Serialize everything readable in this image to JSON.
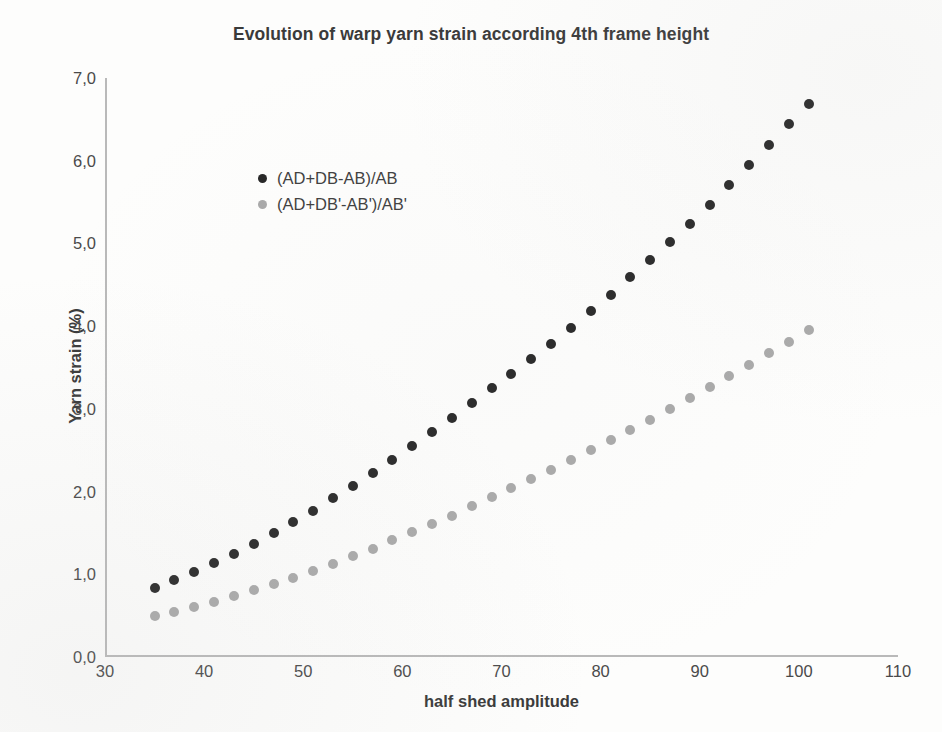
{
  "chart_data": {
    "type": "scatter",
    "title": "Evolution of warp yarn strain according 4th frame height",
    "xlabel": "half shed amplitude",
    "ylabel": "Yarn strain (%)",
    "xlim": [
      30,
      110
    ],
    "ylim": [
      0.0,
      7.0
    ],
    "xticks": [
      30,
      40,
      50,
      60,
      70,
      80,
      90,
      100,
      110
    ],
    "xtick_labels": [
      "30",
      "40",
      "50",
      "60",
      "70",
      "80",
      "90",
      "100",
      "110"
    ],
    "yticks": [
      0.0,
      1.0,
      2.0,
      3.0,
      4.0,
      5.0,
      6.0,
      7.0
    ],
    "ytick_labels": [
      "0,0",
      "1,0",
      "2,0",
      "3,0",
      "4,0",
      "5,0",
      "6,0",
      "7,0"
    ],
    "decimal_separator": ",",
    "grid": false,
    "legend_position": "upper-left-inside",
    "x": [
      35,
      37,
      39,
      41,
      43,
      45,
      47,
      49,
      51,
      53,
      55,
      57,
      59,
      61,
      63,
      65,
      67,
      69,
      71,
      73,
      75,
      77,
      79,
      81,
      83,
      85,
      87,
      89,
      91,
      93,
      95,
      97,
      99,
      101
    ],
    "series": [
      {
        "name": "(AD+DB-AB)/AB",
        "color": "#262626",
        "marker": "circle",
        "values": [
          0.84,
          0.93,
          1.03,
          1.14,
          1.25,
          1.37,
          1.5,
          1.63,
          1.77,
          1.92,
          2.07,
          2.22,
          2.38,
          2.55,
          2.72,
          2.89,
          3.07,
          3.25,
          3.42,
          3.6,
          3.79,
          3.98,
          4.18,
          4.38,
          4.59,
          4.8,
          5.02,
          5.24,
          5.47,
          5.71,
          5.95,
          6.19,
          6.44,
          6.69
        ]
      },
      {
        "name": "(AD+DB'-AB')/AB'",
        "color": "#a9a9a9",
        "marker": "circle",
        "values": [
          0.5,
          0.55,
          0.61,
          0.67,
          0.74,
          0.81,
          0.88,
          0.96,
          1.04,
          1.13,
          1.22,
          1.31,
          1.41,
          1.51,
          1.61,
          1.71,
          1.82,
          1.93,
          2.04,
          2.15,
          2.26,
          2.38,
          2.5,
          2.62,
          2.74,
          2.87,
          3.0,
          3.13,
          3.26,
          3.4,
          3.53,
          3.67,
          3.81,
          3.95
        ]
      }
    ]
  },
  "axis": {
    "xlabel": "half shed amplitude",
    "ylabel": "Yarn strain (%)"
  }
}
